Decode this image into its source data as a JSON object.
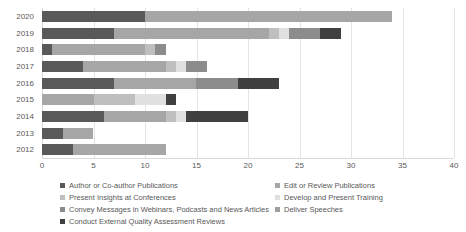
{
  "chart_data": {
    "type": "bar",
    "orientation": "horizontal",
    "stacked": true,
    "title": "",
    "subtitle": "",
    "xlabel": "",
    "ylabel": "",
    "xlim": [
      0,
      40
    ],
    "ylim": null,
    "grid": true,
    "legend_position": "bottom",
    "categories": [
      "2020",
      "2019",
      "2018",
      "2017",
      "2016",
      "2015",
      "2014",
      "2013",
      "2012"
    ],
    "x_ticks": [
      "0",
      "5",
      "10",
      "15",
      "20",
      "25",
      "30",
      "35",
      "40"
    ],
    "x_tick_values": [
      0,
      5,
      10,
      15,
      20,
      25,
      30,
      35,
      40
    ],
    "series": [
      {
        "name": "Author or Co-author Publications",
        "color": "#595959",
        "values": [
          10,
          7,
          1,
          4,
          7,
          0,
          6,
          2,
          3
        ]
      },
      {
        "name": "Edit or Review Publications",
        "color": "#a6a6a6",
        "values": [
          24,
          15,
          9,
          8,
          8,
          5,
          6,
          3,
          9
        ]
      },
      {
        "name": "Present Insights at Conferences",
        "color": "#bfbfbf",
        "values": [
          0,
          1,
          1,
          1,
          0,
          4,
          1,
          0,
          0
        ]
      },
      {
        "name": "Develop and Present Training",
        "color": "#e0e0e0",
        "values": [
          0,
          1,
          0,
          1,
          0,
          3,
          1,
          0,
          0
        ]
      },
      {
        "name": "Convey Messages in Webinars, Podcasts and News Articles",
        "color": "#8c8c8c",
        "values": [
          0,
          3,
          1,
          2,
          4,
          0,
          0,
          0,
          0
        ]
      },
      {
        "name": "Deliver Speeches",
        "color": "#9e9e9e",
        "values": [
          0,
          0,
          0,
          0,
          0,
          0,
          0,
          0,
          0
        ]
      },
      {
        "name": "Conduct External Quality Assessment Reviews",
        "color": "#404040",
        "values": [
          0,
          2,
          0,
          0,
          4,
          1,
          6,
          0,
          0
        ]
      }
    ],
    "totals": [
      34,
      29,
      12,
      16,
      23,
      13,
      20,
      5,
      12
    ]
  },
  "legend": {
    "left_column": [
      "Author or Co-author Publications",
      "Present Insights at Conferences",
      "Convey Messages in Webinars, Podcasts and News Articles",
      "Conduct External Quality Assessment Reviews"
    ],
    "right_column": [
      "Edit or Review Publications",
      "Develop and Present Training",
      "Deliver Speeches"
    ],
    "left_colors": [
      "#595959",
      "#bfbfbf",
      "#8c8c8c",
      "#404040"
    ],
    "right_colors": [
      "#a6a6a6",
      "#e0e0e0",
      "#9e9e9e"
    ]
  },
  "colors": {
    "grid": "#e4e4e4",
    "axis": "#d9d9d9",
    "text": "#595959",
    "background": "#ffffff"
  }
}
